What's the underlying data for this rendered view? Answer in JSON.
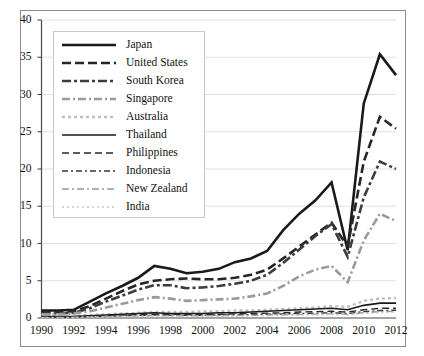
{
  "chart_data": {
    "type": "line",
    "title": "",
    "subtitle": "",
    "xlabel": "",
    "ylabel": "",
    "xlim": [
      1990,
      2012
    ],
    "ylim": [
      0,
      40
    ],
    "x": [
      1990,
      1991,
      1992,
      1993,
      1994,
      1995,
      1996,
      1997,
      1998,
      1999,
      2000,
      2001,
      2002,
      2003,
      2004,
      2005,
      2006,
      2007,
      2008,
      2009,
      2010,
      2011,
      2012
    ],
    "xticks": [
      "1990",
      "1992",
      "1994",
      "1996",
      "1998",
      "2000",
      "2002",
      "2004",
      "2006",
      "2008",
      "2010",
      "2012"
    ],
    "xtick_values": [
      1990,
      1992,
      1994,
      1996,
      1998,
      2000,
      2002,
      2004,
      2006,
      2008,
      2010,
      2012
    ],
    "yticks": [
      "0",
      "5",
      "10",
      "15",
      "20",
      "25",
      "30",
      "35",
      "40"
    ],
    "ytick_values": [
      0,
      5,
      10,
      15,
      20,
      25,
      30,
      35,
      40
    ],
    "grid": true,
    "grid_axis": "y",
    "legend_position": "upper-left-inside",
    "series": [
      {
        "name": "Japan",
        "style": "solid",
        "color": "#1a1a1a",
        "width": 2.6,
        "dash": "",
        "values": [
          1.0,
          1.0,
          1.1,
          2.2,
          3.3,
          4.3,
          5.4,
          7.0,
          6.6,
          6.0,
          6.2,
          6.6,
          7.5,
          8.0,
          9.0,
          11.8,
          14.0,
          15.8,
          18.2,
          9.1,
          28.8,
          35.4,
          32.6
        ]
      },
      {
        "name": "United States",
        "style": "dashed-thick",
        "color": "#262626",
        "width": 2.6,
        "dash": "9,4",
        "values": [
          0.8,
          0.8,
          0.9,
          1.6,
          2.6,
          3.6,
          4.5,
          5.0,
          5.2,
          5.3,
          5.2,
          5.2,
          5.4,
          5.8,
          6.5,
          8.0,
          9.6,
          11.2,
          12.8,
          9.6,
          21.0,
          27.0,
          25.4
        ]
      },
      {
        "name": "South Korea",
        "style": "dash-dot-thick",
        "color": "#3d3d3d",
        "width": 2.6,
        "dash": "9,3,3,3",
        "values": [
          0.6,
          0.6,
          0.7,
          1.3,
          2.2,
          3.0,
          3.8,
          4.4,
          4.4,
          4.0,
          4.1,
          4.3,
          4.6,
          5.0,
          5.8,
          7.4,
          9.2,
          11.0,
          12.6,
          8.2,
          16.2,
          21.0,
          20.0
        ]
      },
      {
        "name": "Singapore",
        "style": "dash-dot-gray",
        "color": "#9a9a9a",
        "width": 2.6,
        "dash": "8,3,2,3",
        "values": [
          0.5,
          0.5,
          0.6,
          0.9,
          1.4,
          1.9,
          2.4,
          2.8,
          2.6,
          2.3,
          2.4,
          2.5,
          2.6,
          2.9,
          3.3,
          4.3,
          5.6,
          6.5,
          7.0,
          4.8,
          10.4,
          14.0,
          13.0
        ]
      },
      {
        "name": "Australia",
        "style": "dotted-gray",
        "color": "#bfbfbf",
        "width": 2.4,
        "dash": "3,3",
        "values": [
          0.3,
          0.3,
          0.3,
          0.4,
          0.5,
          0.6,
          0.7,
          0.8,
          0.8,
          0.8,
          0.9,
          0.9,
          1.0,
          1.0,
          1.1,
          1.2,
          1.3,
          1.4,
          1.6,
          1.5,
          2.3,
          2.6,
          2.7
        ]
      },
      {
        "name": "Thailand",
        "style": "solid-thin",
        "color": "#1a1a1a",
        "width": 1.6,
        "dash": "",
        "values": [
          0.2,
          0.2,
          0.2,
          0.3,
          0.4,
          0.5,
          0.6,
          0.7,
          0.6,
          0.6,
          0.6,
          0.7,
          0.7,
          0.8,
          0.9,
          1.0,
          1.1,
          1.2,
          1.3,
          1.1,
          1.7,
          2.0,
          2.0
        ]
      },
      {
        "name": "Philippines",
        "style": "dashed-thin",
        "color": "#262626",
        "width": 1.4,
        "dash": "7,4",
        "values": [
          0.15,
          0.15,
          0.2,
          0.25,
          0.3,
          0.4,
          0.45,
          0.5,
          0.5,
          0.45,
          0.5,
          0.5,
          0.55,
          0.6,
          0.65,
          0.7,
          0.8,
          0.85,
          0.9,
          0.8,
          1.1,
          1.3,
          1.3
        ]
      },
      {
        "name": "Indonesia",
        "style": "dash-dot-thin",
        "color": "#333333",
        "width": 1.4,
        "dash": "6,3,2,3",
        "values": [
          0.1,
          0.1,
          0.12,
          0.18,
          0.25,
          0.3,
          0.35,
          0.4,
          0.38,
          0.35,
          0.38,
          0.4,
          0.42,
          0.45,
          0.5,
          0.55,
          0.6,
          0.65,
          0.7,
          0.6,
          0.85,
          1.0,
          1.05
        ]
      },
      {
        "name": "New Zealand",
        "style": "dash-dot-gray-thin",
        "color": "#9a9a9a",
        "width": 1.4,
        "dash": "7,3,2,3",
        "values": [
          0.08,
          0.08,
          0.1,
          0.14,
          0.2,
          0.25,
          0.28,
          0.32,
          0.3,
          0.28,
          0.3,
          0.32,
          0.34,
          0.36,
          0.4,
          0.44,
          0.48,
          0.52,
          0.56,
          0.5,
          0.7,
          0.85,
          0.9
        ]
      },
      {
        "name": "India",
        "style": "dotted-light",
        "color": "#c9c9c9",
        "width": 1.4,
        "dash": "2,3",
        "values": [
          0.05,
          0.05,
          0.06,
          0.1,
          0.14,
          0.18,
          0.2,
          0.24,
          0.22,
          0.2,
          0.22,
          0.24,
          0.26,
          0.28,
          0.3,
          0.34,
          0.38,
          0.42,
          0.46,
          0.4,
          0.6,
          0.72,
          0.78
        ]
      }
    ]
  }
}
